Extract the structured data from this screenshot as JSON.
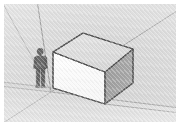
{
  "app": {
    "name": "SketchUp",
    "view_label": "3D Modeling Viewport",
    "projection": "Perspective",
    "style": "Shaded with Textures"
  },
  "viewport": {
    "background_sky_color": "#d4d4d4",
    "background_ground_color": "#cfcfcf",
    "border_color": "#ffffff",
    "horizon_line_color": "#8d8d8d"
  },
  "axes": {
    "label": "Model Axes",
    "origin_label": "Origin",
    "origin": {
      "x": 47,
      "y": 88
    },
    "lines": [
      {
        "name": "green-axis",
        "color": "#8c8c8c",
        "x1": 47,
        "y1": 88,
        "x2": 172,
        "y2": 103
      },
      {
        "name": "green-axis-negative",
        "color": "#9a9a9a",
        "x1": 47,
        "y1": 88,
        "x2": 0,
        "y2": 82
      },
      {
        "name": "red-axis",
        "color": "#8c8c8c",
        "x1": 47,
        "y1": 88,
        "x2": 172,
        "y2": 8
      },
      {
        "name": "red-axis-negative",
        "color": "#9a9a9a",
        "x1": 47,
        "y1": 88,
        "x2": 0,
        "y2": 118
      },
      {
        "name": "blue-axis",
        "color": "#7f7f7f",
        "x1": 47,
        "y1": 88,
        "x2": 34,
        "y2": 0
      },
      {
        "name": "horizon-guide",
        "color": "#9d9d9d",
        "x1": 0,
        "y1": 0,
        "x2": 47,
        "y2": 88
      }
    ]
  },
  "cube": {
    "name": "Cube Component",
    "top_face_color": "#d9d9d9",
    "front_face_color": "#fdfdfd",
    "right_face_color": "#949494",
    "edge_color": "#3b3b3b",
    "top_face_points": "49,48 79,29 129,45 101,68",
    "front_face_points": "49,48 101,68 101,100 49,84",
    "right_face_points": "101,68 129,45 129,79 101,100"
  },
  "scale_figure": {
    "name": "Scale Figure",
    "label": "Person",
    "body_color": "#4a4a4a",
    "outline_color": "#2c2c2c",
    "head_cx": 36,
    "head_cy": 47,
    "shadow_color": "#a9a9a9"
  }
}
